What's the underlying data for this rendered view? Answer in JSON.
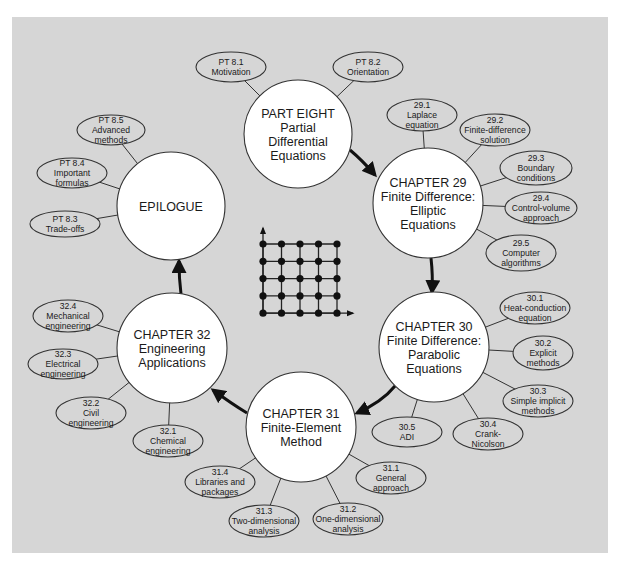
{
  "colors": {
    "panel_bg": "#d6d6d6",
    "node_fill": "#ffffff",
    "topic_fill": "#d6d6d6",
    "stroke": "#333333",
    "arrow": "#111111",
    "text": "#1a1a1a"
  },
  "main_nodes": [
    {
      "id": "part-eight",
      "lines": [
        "PART EIGHT",
        "Partial",
        "Differential",
        "Equations"
      ],
      "cx": 298,
      "cy": 134,
      "r": 54
    },
    {
      "id": "chapter-29",
      "lines": [
        "CHAPTER 29",
        "Finite Difference:",
        "Elliptic",
        "Equations"
      ],
      "cx": 428,
      "cy": 203,
      "r": 55
    },
    {
      "id": "chapter-30",
      "lines": [
        "CHAPTER 30",
        "Finite Difference:",
        "Parabolic",
        "Equations"
      ],
      "cx": 434,
      "cy": 347,
      "r": 55
    },
    {
      "id": "chapter-31",
      "lines": [
        "CHAPTER 31",
        "Finite-Element",
        "Method"
      ],
      "cx": 301,
      "cy": 427,
      "r": 55
    },
    {
      "id": "chapter-32",
      "lines": [
        "CHAPTER 32",
        "Engineering",
        "Applications"
      ],
      "cx": 172,
      "cy": 348,
      "r": 55
    },
    {
      "id": "epilogue",
      "lines": [
        "EPILOGUE"
      ],
      "cx": 171,
      "cy": 206,
      "r": 54
    }
  ],
  "topics": [
    {
      "parent": "part-eight",
      "lines": [
        "PT 8.1",
        "Motivation"
      ],
      "cx": 231,
      "cy": 67,
      "rx": 35,
      "ry": 15
    },
    {
      "parent": "part-eight",
      "lines": [
        "PT 8.2",
        "Orientation"
      ],
      "cx": 368,
      "cy": 67,
      "rx": 35,
      "ry": 15
    },
    {
      "parent": "chapter-29",
      "lines": [
        "29.1",
        "Laplace",
        "equation"
      ],
      "cx": 422,
      "cy": 115,
      "rx": 35,
      "ry": 16
    },
    {
      "parent": "chapter-29",
      "lines": [
        "29.2",
        "Finite-difference",
        "solution"
      ],
      "cx": 495,
      "cy": 130,
      "rx": 35,
      "ry": 16
    },
    {
      "parent": "chapter-29",
      "lines": [
        "29.3",
        "Boundary",
        "conditions"
      ],
      "cx": 536,
      "cy": 168,
      "rx": 36,
      "ry": 17
    },
    {
      "parent": "chapter-29",
      "lines": [
        "29.4",
        "Control-volume",
        "approach"
      ],
      "cx": 541,
      "cy": 208,
      "rx": 36,
      "ry": 16
    },
    {
      "parent": "chapter-29",
      "lines": [
        "29.5",
        "Computer",
        "algorithms"
      ],
      "cx": 521,
      "cy": 253,
      "rx": 35,
      "ry": 18
    },
    {
      "parent": "chapter-30",
      "lines": [
        "30.1",
        "Heat-conduction",
        "equation"
      ],
      "cx": 535,
      "cy": 308,
      "rx": 35,
      "ry": 16
    },
    {
      "parent": "chapter-30",
      "lines": [
        "30.2",
        "Explicit",
        "methods"
      ],
      "cx": 543,
      "cy": 353,
      "rx": 30,
      "ry": 17
    },
    {
      "parent": "chapter-30",
      "lines": [
        "30.3",
        "Simple implicit",
        "methods"
      ],
      "cx": 538,
      "cy": 401,
      "rx": 35,
      "ry": 16
    },
    {
      "parent": "chapter-30",
      "lines": [
        "30.4",
        "Crank-",
        "Nicolson"
      ],
      "cx": 488,
      "cy": 434,
      "rx": 35,
      "ry": 16
    },
    {
      "parent": "chapter-30",
      "lines": [
        "30.5",
        "ADI"
      ],
      "cx": 407,
      "cy": 432,
      "rx": 35,
      "ry": 15
    },
    {
      "parent": "chapter-31",
      "lines": [
        "31.1",
        "General",
        "approach"
      ],
      "cx": 391,
      "cy": 478,
      "rx": 35,
      "ry": 16
    },
    {
      "parent": "chapter-31",
      "lines": [
        "31.2",
        "One-dimensional",
        "analysis"
      ],
      "cx": 348,
      "cy": 519,
      "rx": 35,
      "ry": 16
    },
    {
      "parent": "chapter-31",
      "lines": [
        "31.3",
        "Two-dimensional",
        "analysis"
      ],
      "cx": 264,
      "cy": 521,
      "rx": 35,
      "ry": 16
    },
    {
      "parent": "chapter-31",
      "lines": [
        "31.4",
        "Libraries and",
        "packages"
      ],
      "cx": 220,
      "cy": 482,
      "rx": 35,
      "ry": 16
    },
    {
      "parent": "chapter-32",
      "lines": [
        "32.1",
        "Chemical",
        "engineering"
      ],
      "cx": 168,
      "cy": 441,
      "rx": 35,
      "ry": 16
    },
    {
      "parent": "chapter-32",
      "lines": [
        "32.2",
        "Civil",
        "engineering"
      ],
      "cx": 91,
      "cy": 413,
      "rx": 35,
      "ry": 16
    },
    {
      "parent": "chapter-32",
      "lines": [
        "32.3",
        "Electrical",
        "engineering"
      ],
      "cx": 63,
      "cy": 364,
      "rx": 35,
      "ry": 15
    },
    {
      "parent": "chapter-32",
      "lines": [
        "32.4",
        "Mechanical",
        "engineering"
      ],
      "cx": 68,
      "cy": 316,
      "rx": 35,
      "ry": 16
    },
    {
      "parent": "epilogue",
      "lines": [
        "PT 8.3",
        "Trade-offs"
      ],
      "cx": 65,
      "cy": 224,
      "rx": 35,
      "ry": 13
    },
    {
      "parent": "epilogue",
      "lines": [
        "PT 8.4",
        "Important",
        "formulas"
      ],
      "cx": 72,
      "cy": 173,
      "rx": 35,
      "ry": 15
    },
    {
      "parent": "epilogue",
      "lines": [
        "PT 8.5",
        "Advanced",
        "methods"
      ],
      "cx": 111,
      "cy": 130,
      "rx": 34,
      "ry": 15
    }
  ],
  "flow_arrows": [
    {
      "from": "part-eight",
      "to": "chapter-29",
      "d": "M350,150 Q362,160 375,175"
    },
    {
      "from": "chapter-29",
      "to": "chapter-30",
      "d": "M431,258 Q433,276 432,292"
    },
    {
      "from": "chapter-30",
      "to": "chapter-31",
      "d": "M395,386 Q382,402 357,413"
    },
    {
      "from": "chapter-31",
      "to": "chapter-32",
      "d": "M247,413 Q232,404 213,390"
    },
    {
      "from": "chapter-32",
      "to": "epilogue",
      "d": "M181,294 Q179,278 179,261"
    }
  ],
  "grid_icon": {
    "x0": 263,
    "y0": 244,
    "dx": 18.5,
    "dy": 17.3,
    "n": 5,
    "y_axis_top": 228,
    "x_axis_right": 353
  }
}
